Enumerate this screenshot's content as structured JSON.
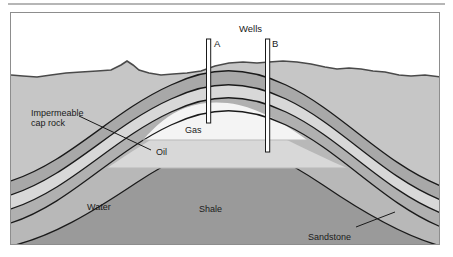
{
  "figure": {
    "type": "geological-cross-section"
  },
  "labels": {
    "wells": "Wells",
    "well_a": "A",
    "well_b": "B",
    "cap_rock_line1": "Impermeable",
    "cap_rock_line2": "cap rock",
    "gas": "Gas",
    "oil": "Oil",
    "water": "Water",
    "shale": "Shale",
    "sandstone": "Sandstone"
  },
  "layers": [
    {
      "name": "overburden",
      "label": "",
      "color": "#c6c6c6"
    },
    {
      "name": "cap-rock",
      "label": "Impermeable cap rock",
      "color": "#a8a8a8"
    },
    {
      "name": "gas",
      "label": "Gas",
      "color": "#f4f4f4"
    },
    {
      "name": "oil",
      "label": "Oil",
      "color": "#d8d8d8"
    },
    {
      "name": "water",
      "label": "Water",
      "color": "#b0b0b0"
    },
    {
      "name": "shale",
      "label": "Shale",
      "color": "#9a9a9a"
    },
    {
      "name": "sandstone",
      "label": "Sandstone",
      "color": "#b8b8b8"
    }
  ],
  "wells": [
    {
      "id": "A",
      "label": "A",
      "x": 207,
      "top": 38,
      "bottom": 122,
      "terminates_in": "Gas"
    },
    {
      "id": "B",
      "label": "B",
      "x": 266,
      "top": 38,
      "bottom": 151,
      "terminates_in": "Oil"
    }
  ],
  "colors": {
    "frame": "#8d8d8d",
    "outline": "#1a1a1a",
    "sky": "#ffffff",
    "overburden": "#c6c6c6",
    "cap_rock": "#a8a8a8",
    "gas": "#f4f4f4",
    "oil": "#d8d8d8",
    "water": "#b0b0b0",
    "shale": "#9a9a9a",
    "sandstone": "#b8b8b8",
    "text": "#1a1a1a"
  }
}
